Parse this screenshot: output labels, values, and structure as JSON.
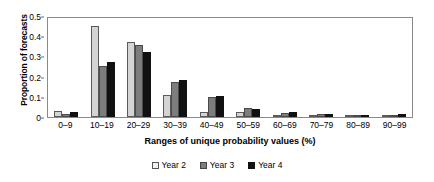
{
  "chart_data": {
    "type": "bar",
    "title": "",
    "xlabel": "Ranges of unique probability values (%)",
    "ylabel": "Proportion of forecasts",
    "categories": [
      "0–9",
      "10–19",
      "20–29",
      "30–39",
      "40–49",
      "50–59",
      "60–69",
      "70–79",
      "80–89",
      "90–99"
    ],
    "ylim": [
      0,
      0.5
    ],
    "yticks": [
      0,
      0.1,
      0.2,
      0.3,
      0.4,
      0.5
    ],
    "ytick_labels": [
      "0",
      "0.1",
      "0.2",
      "0.3",
      "0.4",
      "0.5"
    ],
    "grid": false,
    "legend_position": "bottom-center",
    "series": [
      {
        "name": "Year 2",
        "color": "#d4d4d4",
        "values": [
          0.03,
          0.45,
          0.37,
          0.11,
          0.025,
          0.025,
          0.01,
          0.005,
          0.005,
          0.005
        ]
      },
      {
        "name": "Year 3",
        "color": "#7d7d7d",
        "values": [
          0.015,
          0.255,
          0.355,
          0.175,
          0.1,
          0.045,
          0.02,
          0.015,
          0.01,
          0.01
        ]
      },
      {
        "name": "Year 4",
        "color": "#111111",
        "values": [
          0.025,
          0.27,
          0.32,
          0.185,
          0.105,
          0.04,
          0.025,
          0.015,
          0.01,
          0.015
        ]
      }
    ]
  },
  "legend": {
    "items": [
      {
        "label": "Year 2"
      },
      {
        "label": "Year 3"
      },
      {
        "label": "Year 4"
      }
    ]
  }
}
